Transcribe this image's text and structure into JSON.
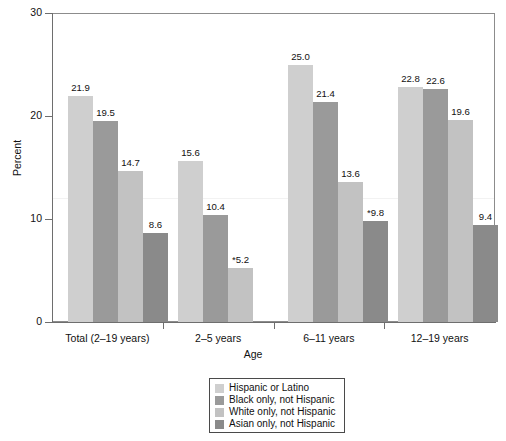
{
  "chart_data": {
    "type": "bar",
    "title": "",
    "xlabel": "Age",
    "ylabel": "Percent",
    "ylim": [
      0,
      30
    ],
    "yticks": [
      "0",
      "10",
      "20",
      "30"
    ],
    "grid": false,
    "legend_position": "bottom-center",
    "categories": [
      "Total (2–19 years)",
      "2–5 years",
      "6–11 years",
      "12–19 years"
    ],
    "series": [
      {
        "name": "Hispanic or Latino",
        "color": "#cfcfcf",
        "values": [
          21.9,
          15.6,
          25.0,
          22.8
        ],
        "labels": [
          "21.9",
          "15.6",
          "25.0",
          "22.8"
        ]
      },
      {
        "name": "Black only, not Hispanic",
        "color": "#9a9a9a",
        "values": [
          19.5,
          10.4,
          21.4,
          22.6
        ],
        "labels": [
          "19.5",
          "10.4",
          "21.4",
          "22.6"
        ]
      },
      {
        "name": "White only, not Hispanic",
        "color": "#c2c2c2",
        "values": [
          14.7,
          5.2,
          13.6,
          19.6
        ],
        "labels": [
          "14.7",
          "*5.2",
          "13.6",
          "19.6"
        ]
      },
      {
        "name": "Asian only, not Hispanic",
        "color": "#8a8a8a",
        "values": [
          8.6,
          5.2,
          9.8,
          9.4
        ],
        "labels": [
          "8.6",
          "*5.2",
          "*9.8",
          "9.4"
        ]
      }
    ]
  },
  "axes": {
    "y_title": "Percent",
    "x_title": "Age",
    "y_tick_labels": [
      "30",
      "20",
      "10",
      "0"
    ],
    "x_group_labels": [
      "Total (2–19 years)",
      "2–5 years",
      "6–11 years",
      "12–19 years"
    ]
  },
  "bars": [
    {
      "group": 0,
      "series": 0,
      "label": "21.9"
    },
    {
      "group": 0,
      "series": 1,
      "label": "19.5"
    },
    {
      "group": 0,
      "series": 2,
      "label": "14.7"
    },
    {
      "group": 0,
      "series": 3,
      "label": "8.6"
    },
    {
      "group": 1,
      "series": 0,
      "label": "15.6"
    },
    {
      "group": 1,
      "series": 1,
      "label": "10.4"
    },
    {
      "group": 1,
      "series": 2,
      "label": "*5.2"
    },
    {
      "group": 2,
      "series": 0,
      "label": "25.0"
    },
    {
      "group": 2,
      "series": 1,
      "label": "21.4"
    },
    {
      "group": 2,
      "series": 2,
      "label": "13.6"
    },
    {
      "group": 2,
      "series": 3,
      "label": "*9.8"
    },
    {
      "group": 3,
      "series": 0,
      "label": "22.8"
    },
    {
      "group": 3,
      "series": 1,
      "label": "22.6"
    },
    {
      "group": 3,
      "series": 2,
      "label": "19.6"
    },
    {
      "group": 3,
      "series": 3,
      "label": "9.4"
    }
  ],
  "legend": {
    "items": [
      {
        "label": "Hispanic or Latino",
        "color": "#cfcfcf"
      },
      {
        "label": "Black only, not Hispanic",
        "color": "#9a9a9a"
      },
      {
        "label": "White only, not Hispanic",
        "color": "#c2c2c2"
      },
      {
        "label": "Asian only, not Hispanic",
        "color": "#8a8a8a"
      }
    ]
  }
}
